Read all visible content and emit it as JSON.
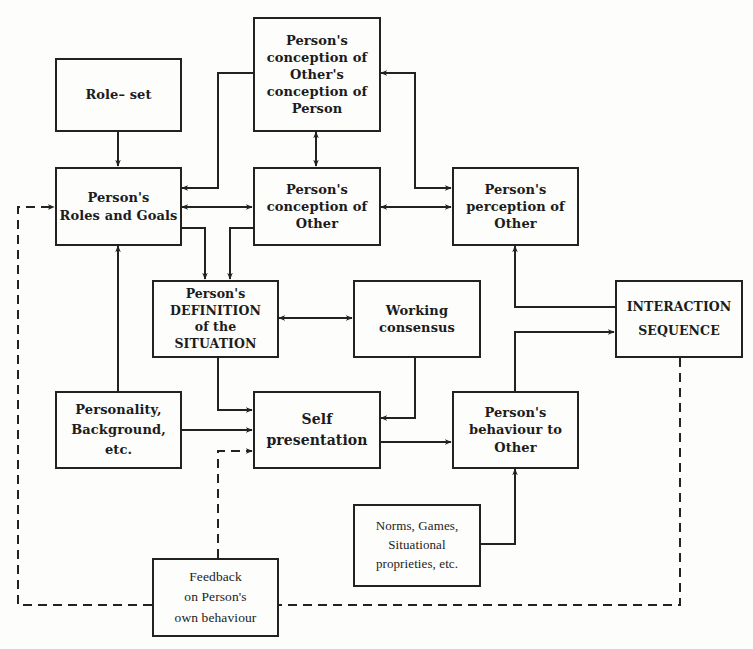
{
  "diagram": {
    "type": "flowchart",
    "line_color": "#222222",
    "background": "#fdfdfb",
    "nodes": {
      "role_set": {
        "label": "Role– set"
      },
      "meta_conception": {
        "label": "Person's\nconception of\nOther's\nconception of\nPerson"
      },
      "roles_goals": {
        "label": "Person's\nRoles and Goals"
      },
      "conception_other": {
        "label": "Person's\nconception of\nOther"
      },
      "perception_other": {
        "label": "Person's\nperception of\nOther"
      },
      "definition_situation": {
        "label": "Person's\nDEFINITION\nof the\nSITUATION"
      },
      "working_consensus": {
        "label": "Working\nconsensus"
      },
      "interaction_sequence": {
        "label": "INTERACTION\nSEQUENCE"
      },
      "personality": {
        "label": "Personality,\nBackground,\netc."
      },
      "self_presentation": {
        "label": "Self\npresentation"
      },
      "behaviour_other": {
        "label": "Person's\nbehaviour to\nOther"
      },
      "norms": {
        "label": "Norms, Games,\nSituational\nproprieties, etc."
      },
      "feedback": {
        "label": "Feedback\non Person's\nown behaviour"
      }
    },
    "edges": [
      {
        "from": "role_set",
        "to": "roles_goals",
        "style": "solid",
        "direction": "forward"
      },
      {
        "from": "meta_conception",
        "to": "roles_goals",
        "style": "solid",
        "direction": "forward"
      },
      {
        "from": "meta_conception",
        "to": "conception_other",
        "style": "solid",
        "direction": "both"
      },
      {
        "from": "meta_conception",
        "to": "perception_other",
        "style": "solid",
        "direction": "both"
      },
      {
        "from": "roles_goals",
        "to": "conception_other",
        "style": "solid",
        "direction": "both"
      },
      {
        "from": "conception_other",
        "to": "perception_other",
        "style": "solid",
        "direction": "both"
      },
      {
        "from": "roles_goals",
        "to": "definition_situation",
        "style": "solid",
        "direction": "forward"
      },
      {
        "from": "conception_other",
        "to": "definition_situation",
        "style": "solid",
        "direction": "forward"
      },
      {
        "from": "definition_situation",
        "to": "working_consensus",
        "style": "solid",
        "direction": "both"
      },
      {
        "from": "personality",
        "to": "roles_goals",
        "style": "solid",
        "direction": "forward"
      },
      {
        "from": "definition_situation",
        "to": "self_presentation",
        "style": "solid",
        "direction": "forward"
      },
      {
        "from": "personality",
        "to": "self_presentation",
        "style": "solid",
        "direction": "forward"
      },
      {
        "from": "working_consensus",
        "to": "self_presentation",
        "style": "solid",
        "direction": "forward"
      },
      {
        "from": "self_presentation",
        "to": "behaviour_other",
        "style": "solid",
        "direction": "forward"
      },
      {
        "from": "behaviour_other",
        "to": "interaction_sequence",
        "style": "solid",
        "direction": "forward"
      },
      {
        "from": "interaction_sequence",
        "to": "perception_other",
        "style": "solid",
        "direction": "forward"
      },
      {
        "from": "norms",
        "to": "behaviour_other",
        "style": "solid",
        "direction": "forward"
      },
      {
        "from": "interaction_sequence",
        "to": "feedback",
        "style": "dashed",
        "direction": "forward"
      },
      {
        "from": "feedback",
        "to": "roles_goals",
        "style": "dashed",
        "direction": "forward"
      },
      {
        "from": "feedback",
        "to": "self_presentation",
        "style": "dashed",
        "direction": "forward"
      }
    ]
  }
}
